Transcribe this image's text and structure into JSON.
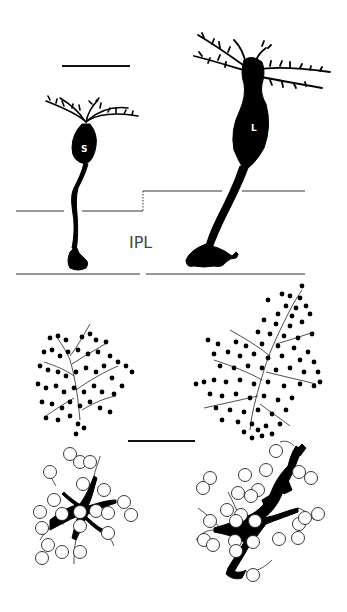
{
  "figure": {
    "type": "scientific illustration",
    "colors": {
      "ink": "#000000",
      "line": "#333333",
      "background": "#ffffff",
      "label": "#444444"
    }
  },
  "labels": {
    "layer": "IPL",
    "cell_small": "S",
    "cell_large": "L"
  },
  "panels": {
    "top": {
      "name": "vertical-view",
      "cells": [
        "S",
        "L"
      ],
      "layer_label": "IPL"
    },
    "middle": {
      "name": "dendritic-field-whole-mount",
      "left_dots": "filled",
      "right_dots": "filled"
    },
    "bottom": {
      "name": "axon-terminal-whole-mount",
      "left_circles": "open",
      "right_circles": "open"
    }
  },
  "scale_bars": [
    {
      "id": "top",
      "x1": 62,
      "x2": 130,
      "y": 66
    },
    {
      "id": "middle",
      "x1": 128,
      "x2": 195,
      "y": 441
    }
  ]
}
